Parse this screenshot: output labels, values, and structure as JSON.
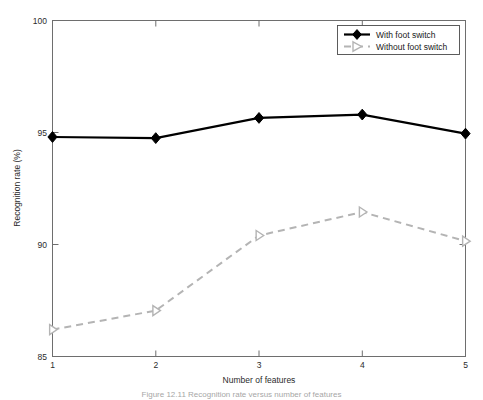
{
  "figure": {
    "background_color": "#ffffff",
    "caption": "Figure 12.11  Recognition rate versus number of features"
  },
  "chart_data": {
    "type": "line",
    "title": "",
    "xlabel": "Number of features",
    "ylabel": "Recognition rate (%)",
    "x": [
      1,
      2,
      3,
      4,
      5
    ],
    "xticklabels": [
      "1",
      "2",
      "3",
      "4",
      "5"
    ],
    "yticks": [
      85,
      90,
      95,
      100
    ],
    "yticklabels": [
      "85",
      "90",
      "95",
      "100"
    ],
    "xlim": [
      1,
      5
    ],
    "ylim": [
      85,
      100
    ],
    "grid": false,
    "legend_position": "upper right",
    "series": [
      {
        "name": "With foot switch",
        "values": [
          94.8,
          94.75,
          95.65,
          95.8,
          94.95
        ],
        "color": "#000000",
        "linestyle": "solid",
        "marker": "diamond"
      },
      {
        "name": "Without foot switch",
        "values": [
          86.2,
          87.05,
          90.4,
          91.45,
          90.15
        ],
        "color": "#b4b4b4",
        "linestyle": "dashed",
        "marker": "triangle-right"
      }
    ]
  }
}
